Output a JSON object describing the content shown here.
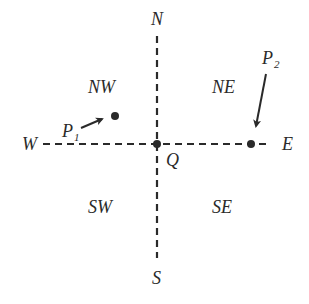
{
  "diagram": {
    "compass": {
      "north": "N",
      "south": "S",
      "east": "E",
      "west": "W"
    },
    "quadrants": {
      "nw": "NW",
      "ne": "NE",
      "sw": "SW",
      "se": "SE"
    },
    "origin_label": "Q",
    "points": [
      {
        "base": "P",
        "sub": "1"
      },
      {
        "base": "P",
        "sub": "2"
      }
    ],
    "colors": {
      "ink": "#2a2a2a",
      "background": "#ffffff"
    }
  }
}
